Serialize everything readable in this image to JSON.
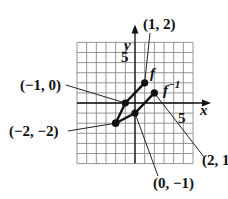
{
  "chart_data": {
    "type": "line",
    "title": "",
    "xlabel": "x",
    "ylabel": "y",
    "xlim": [
      -6,
      6
    ],
    "ylim": [
      -6,
      6
    ],
    "grid": true,
    "tick_labels": {
      "x": [
        "5"
      ],
      "y": [
        "5"
      ]
    },
    "series": [
      {
        "name": "f",
        "points": [
          [
            -2,
            -2
          ],
          [
            -1,
            0
          ],
          [
            1,
            2
          ]
        ]
      },
      {
        "name": "f⁻¹",
        "points": [
          [
            -2,
            -2
          ],
          [
            0,
            -1
          ],
          [
            2,
            1
          ]
        ]
      }
    ],
    "annotations": [
      {
        "text": "(1, 2)",
        "point": [
          1,
          2
        ]
      },
      {
        "text": "(−1, 0)",
        "point": [
          -1,
          0
        ]
      },
      {
        "text": "(−2, −2)",
        "point": [
          -2,
          -2
        ]
      },
      {
        "text": "(0, −1)",
        "point": [
          0,
          -1
        ]
      },
      {
        "text": "(2, 1",
        "point": [
          2,
          1
        ]
      }
    ]
  },
  "labels": {
    "x_axis": "x",
    "y_axis": "y",
    "x_tick": "5",
    "y_tick": "5",
    "f": "f",
    "finv_base": "f",
    "finv_sup": "−1",
    "p_1_2": "(1, 2)",
    "p_m1_0": "(−1, 0)",
    "p_m2_m2": "(−2, −2)",
    "p_0_m1": "(0, −1)",
    "p_2_1": "(2, 1"
  }
}
